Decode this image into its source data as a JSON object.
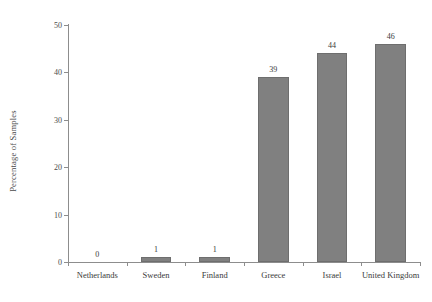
{
  "chart_data": {
    "type": "bar",
    "title": "",
    "subtitle": "",
    "xlabel": "",
    "ylabel": "Percentage of Samples",
    "categories": [
      "Netherlands",
      "Sweden",
      "Finland",
      "Greece",
      "Israel",
      "United Kingdom"
    ],
    "values": [
      0,
      1,
      1,
      39,
      44,
      46
    ],
    "value_labels": [
      "0",
      "1",
      "1",
      "39",
      "44",
      "46"
    ],
    "ylim": [
      0,
      50
    ],
    "ytick_labels": [
      "0",
      "10",
      "20",
      "30",
      "40",
      "50"
    ],
    "ytick_values": [
      0,
      10,
      20,
      30,
      40,
      50
    ],
    "grid": false,
    "legend": false,
    "legend_position": "none",
    "bar_color": "#808080",
    "bar_edge_color": "#6e6e6e",
    "axis_color": "#8d8d8d",
    "background_color": "#ffffff",
    "text_color": "#3a3a3a"
  }
}
